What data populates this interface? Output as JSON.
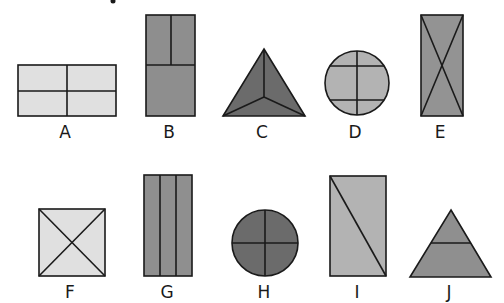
{
  "colors": {
    "light": "#e0e0e0",
    "medium_light": "#b3b3b3",
    "medium": "#8e8e8e",
    "dark": "#6b6b6b",
    "stroke": "#1a1a1a"
  },
  "shapes": [
    {
      "label": "A",
      "shape": "rectangle",
      "division": "quartered by one vertical and one horizontal line",
      "parts": 4,
      "fill": "light"
    },
    {
      "label": "B",
      "shape": "rectangle",
      "division": "horizontal line across middle; upper half split by vertical line",
      "parts": 3,
      "fill": "medium"
    },
    {
      "label": "C",
      "shape": "triangle",
      "division": "three lines from center to vertices",
      "parts": 3,
      "fill": "dark"
    },
    {
      "label": "D",
      "shape": "circle",
      "division": "one vertical line and two horizontal lines",
      "parts": 6,
      "fill": "medium_light"
    },
    {
      "label": "E",
      "shape": "rectangle",
      "division": "two diagonals",
      "parts": 4,
      "fill": "medium"
    },
    {
      "label": "F",
      "shape": "square",
      "division": "two diagonals",
      "parts": 4,
      "fill": "light"
    },
    {
      "label": "G",
      "shape": "rectangle",
      "division": "two vertical lines",
      "parts": 3,
      "fill": "medium"
    },
    {
      "label": "H",
      "shape": "circle",
      "division": "one vertical and one horizontal diameter",
      "parts": 4,
      "fill": "dark"
    },
    {
      "label": "I",
      "shape": "rectangle",
      "division": "one diagonal",
      "parts": 2,
      "fill": "medium_light"
    },
    {
      "label": "J",
      "shape": "triangle",
      "division": "one horizontal line",
      "parts": 2,
      "fill": "medium"
    }
  ]
}
